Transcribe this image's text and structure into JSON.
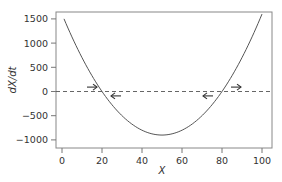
{
  "chart_data": {
    "type": "line",
    "title": "",
    "xlabel": "X",
    "ylabel": "dX/dt",
    "xlim": [
      -2,
      103
    ],
    "ylim": [
      -1050,
      1680
    ],
    "xticks": [
      0,
      20,
      40,
      60,
      80,
      100
    ],
    "yticks": [
      1500,
      1000,
      500,
      0,
      -500,
      -1000
    ],
    "xtick_labels": [
      "0",
      "20",
      "40",
      "60",
      "80",
      "100"
    ],
    "ytick_labels": [
      "1500",
      "1000",
      "500",
      "0",
      "−500",
      "−1000"
    ],
    "grid": false,
    "legend": null,
    "series": [
      {
        "name": "dX/dt",
        "formula": "(X-20)(X-80)",
        "x": [
          1,
          10,
          20,
          30,
          40,
          50,
          60,
          70,
          80,
          90,
          100
        ],
        "values": [
          1501,
          700,
          0,
          -500,
          -800,
          -900,
          -800,
          -500,
          0,
          700,
          1600
        ],
        "style": "solid",
        "color": "#555555"
      },
      {
        "name": "zero-line",
        "x": [
          0,
          100
        ],
        "values": [
          0,
          0
        ],
        "style": "dashed",
        "color": "#555555"
      }
    ],
    "annotations": [
      {
        "type": "arrow",
        "direction": "right",
        "x": 15,
        "y": 60,
        "position": "above"
      },
      {
        "type": "arrow",
        "direction": "left",
        "x": 27,
        "y": -60,
        "position": "below"
      },
      {
        "type": "arrow",
        "direction": "left",
        "x": 73,
        "y": -60,
        "position": "below"
      },
      {
        "type": "arrow",
        "direction": "right",
        "x": 87,
        "y": 60,
        "position": "above"
      }
    ],
    "colors": {
      "curve": "#555555",
      "axis": "#777777",
      "text": "#333333"
    }
  }
}
